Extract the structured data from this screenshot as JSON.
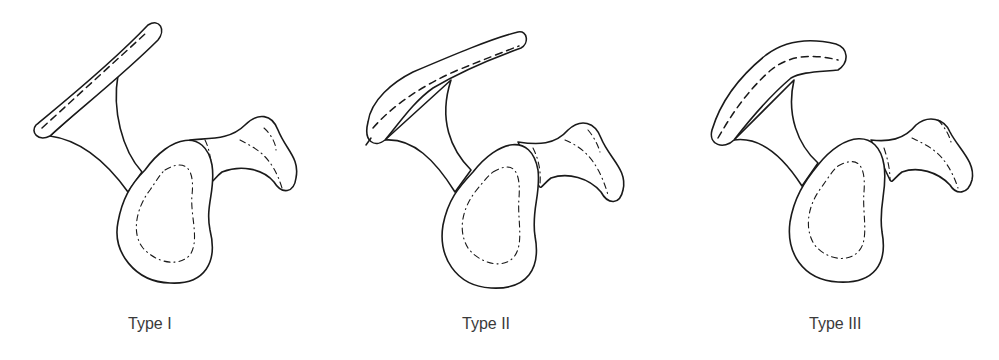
{
  "figure": {
    "panels": [
      {
        "label": "Type I",
        "shape": "flat acromion"
      },
      {
        "label": "Type II",
        "shape": "curved acromion"
      },
      {
        "label": "Type III",
        "shape": "hooked acromion"
      }
    ]
  }
}
